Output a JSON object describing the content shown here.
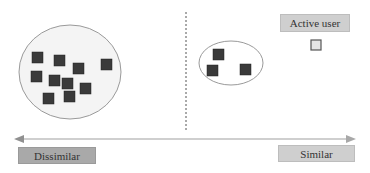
{
  "diagram": {
    "labels": {
      "active_user": "Active user",
      "dissimilar": "Dissimilar",
      "similar": "Similar"
    },
    "clusters": [
      {
        "name": "dissimilar-cluster",
        "member_count": 10
      },
      {
        "name": "similar-cluster",
        "member_count": 3
      }
    ],
    "colors": {
      "user_square": "#3a3a3a",
      "active_user_square": "#e6e6e6",
      "cluster_outline": "#9a9a9a",
      "cluster_fill": "#f4f4f4",
      "axis": "#a0a0a0",
      "divider": "#555555"
    }
  }
}
